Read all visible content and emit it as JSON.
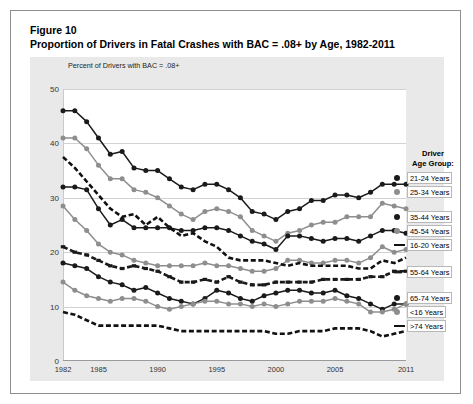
{
  "figure": {
    "label": "Figure 10",
    "title": "Proportion of Drivers in Fatal Crashes with BAC = .08+ by Age, 1982-2011"
  },
  "legend": {
    "title_line1": "Driver",
    "title_line2": "Age Group:"
  },
  "chart_data": {
    "type": "line",
    "title": "Proportion of Drivers in Fatal Crashes with BAC = .08+ by Age, 1982-2011",
    "xlabel": "",
    "ylabel": "Percent of Drivers with BAC = .08+",
    "ylim": [
      0,
      50
    ],
    "yticks": [
      0,
      10,
      20,
      30,
      40,
      50
    ],
    "grid": true,
    "legend_position": "right",
    "xlim": [
      1982,
      2011
    ],
    "xticks": [
      1982,
      1985,
      1990,
      1995,
      2000,
      2005,
      2011
    ],
    "x": [
      1982,
      1983,
      1984,
      1985,
      1986,
      1987,
      1988,
      1989,
      1990,
      1991,
      1992,
      1993,
      1994,
      1995,
      1996,
      1997,
      1998,
      1999,
      2000,
      2001,
      2002,
      2003,
      2004,
      2005,
      2006,
      2007,
      2008,
      2009,
      2010,
      2011
    ],
    "series": [
      {
        "name": "21-24 Years",
        "marker": "circle",
        "color": "#1a1a1a",
        "style": "solid",
        "values": [
          46.0,
          46.0,
          44.0,
          41.0,
          38.0,
          38.5,
          35.5,
          35.0,
          35.0,
          33.5,
          32.0,
          31.5,
          32.5,
          32.5,
          31.5,
          30.0,
          27.5,
          27.0,
          26.0,
          27.5,
          28.0,
          29.5,
          29.5,
          30.5,
          30.5,
          30.0,
          31.0,
          32.5,
          32.5,
          32.5
        ]
      },
      {
        "name": "25-34 Years",
        "marker": "circle",
        "color": "#8e8e8e",
        "style": "solid",
        "values": [
          41.0,
          41.0,
          39.0,
          36.0,
          33.5,
          33.5,
          31.5,
          31.0,
          30.0,
          28.5,
          27.0,
          26.0,
          27.5,
          28.0,
          27.5,
          26.5,
          24.0,
          23.0,
          22.0,
          23.5,
          24.0,
          25.0,
          25.5,
          25.5,
          26.5,
          26.5,
          26.5,
          29.0,
          28.5,
          28.0
        ]
      },
      {
        "name": "35-44 Years",
        "marker": "circle",
        "color": "#1a1a1a",
        "style": "solid",
        "values": [
          32.0,
          32.0,
          31.5,
          28.0,
          25.0,
          26.0,
          24.5,
          24.5,
          24.5,
          24.5,
          24.0,
          24.0,
          24.5,
          24.5,
          24.0,
          23.0,
          22.0,
          21.5,
          20.5,
          23.0,
          23.0,
          22.5,
          22.0,
          22.5,
          22.5,
          22.0,
          23.0,
          24.0,
          24.0,
          23.5
        ]
      },
      {
        "name": "45-54 Years",
        "marker": "circle",
        "color": "#8e8e8e",
        "style": "solid",
        "values": [
          28.5,
          26.0,
          24.0,
          21.5,
          20.0,
          19.5,
          18.5,
          18.0,
          17.5,
          17.5,
          17.5,
          17.5,
          18.0,
          17.5,
          17.5,
          17.0,
          16.5,
          16.5,
          17.0,
          18.5,
          18.5,
          18.0,
          18.0,
          18.5,
          18.5,
          18.0,
          19.0,
          21.0,
          20.0,
          20.5
        ]
      },
      {
        "name": "16-20 Years",
        "marker": "none",
        "color": "#111111",
        "style": "dashed",
        "values": [
          37.5,
          35.5,
          33.0,
          30.5,
          28.0,
          26.5,
          27.0,
          25.0,
          26.5,
          24.5,
          23.0,
          23.5,
          22.0,
          21.0,
          19.0,
          18.5,
          18.5,
          18.5,
          18.0,
          17.5,
          18.0,
          17.5,
          17.5,
          17.5,
          17.5,
          17.0,
          17.0,
          18.5,
          18.0,
          19.0
        ]
      },
      {
        "name": "55-64 Years",
        "marker": "square",
        "color": "#1a1a1a",
        "style": "dashed",
        "values": [
          21.0,
          20.0,
          19.5,
          18.5,
          17.5,
          17.0,
          17.5,
          17.0,
          16.5,
          15.5,
          14.5,
          14.5,
          15.0,
          14.5,
          15.5,
          14.5,
          14.0,
          14.0,
          14.5,
          14.5,
          14.5,
          14.5,
          15.0,
          15.0,
          15.0,
          15.0,
          15.5,
          15.5,
          16.5,
          16.5
        ]
      },
      {
        "name": "65-74 Years",
        "marker": "circle",
        "color": "#1a1a1a",
        "style": "solid",
        "values": [
          18.0,
          17.5,
          17.0,
          15.5,
          14.5,
          14.0,
          13.0,
          13.5,
          12.5,
          11.5,
          11.0,
          10.5,
          11.5,
          13.0,
          12.5,
          11.5,
          11.0,
          12.0,
          12.5,
          13.0,
          13.0,
          12.5,
          12.5,
          13.0,
          12.0,
          11.5,
          10.5,
          9.5,
          10.5,
          10.5
        ]
      },
      {
        "name": "<16 Years",
        "marker": "circle",
        "color": "#8e8e8e",
        "style": "solid",
        "values": [
          14.5,
          13.0,
          12.0,
          11.5,
          11.0,
          11.5,
          11.5,
          11.0,
          10.0,
          9.5,
          10.0,
          10.5,
          11.0,
          11.0,
          10.5,
          10.5,
          10.0,
          10.5,
          10.0,
          10.5,
          11.0,
          11.0,
          11.0,
          11.5,
          11.0,
          10.5,
          9.0,
          9.0,
          9.5,
          10.5
        ]
      },
      {
        "name": ">74 Years",
        "marker": "none",
        "color": "#111111",
        "style": "dashed",
        "values": [
          9.0,
          8.5,
          7.5,
          6.5,
          6.5,
          6.5,
          6.5,
          6.5,
          6.5,
          6.0,
          5.5,
          5.5,
          5.5,
          5.5,
          5.5,
          5.5,
          5.5,
          5.5,
          5.0,
          5.0,
          5.5,
          5.5,
          5.5,
          6.0,
          6.0,
          6.0,
          5.5,
          4.5,
          5.0,
          5.5
        ]
      }
    ]
  }
}
